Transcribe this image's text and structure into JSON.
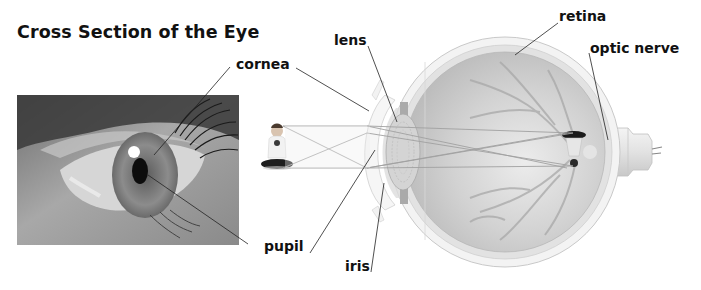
{
  "figure": {
    "title": "Cross Section of the Eye",
    "labels": {
      "cornea": "cornea",
      "lens": "lens",
      "retina": "retina",
      "optic_nerve": "optic nerve",
      "pupil": "pupil",
      "iris": "iris"
    },
    "panels": {
      "photo": "close-up photograph of a human eye",
      "illustration": "cross-section illustration of the eyeball with light rays from a seated child forming an inverted image on the retina"
    }
  }
}
